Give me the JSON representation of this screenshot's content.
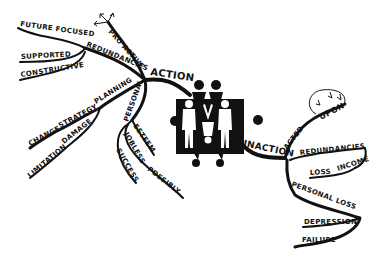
{
  "mind_map": {
    "center": {
      "label": "people emblem",
      "icon": "family-group-icon"
    },
    "colors": {
      "ink": "#111111",
      "background": "#ffffff"
    },
    "action": {
      "label": "ACTION",
      "branches": {
        "pro_active": "PRO ACTIVE",
        "redundancies": "REDUNDANCIES",
        "future_focused": "FUTURE FOCUSED",
        "supported": "SUPPORTED",
        "constructive": "CONSTRUCTIVE",
        "planning": "PLANNING",
        "strategy": "STRATEGY",
        "change": "CHANGE",
        "damage": "DAMAGE",
        "limitation": "LIMITATION",
        "personal": "PERSONAL",
        "esteem": "ESTEEM",
        "jobless": "JOBLESS",
        "possibly": "POSSIBLY",
        "success": "SUCCESS"
      }
    },
    "inaction": {
      "label": "INACTION",
      "branches": {
        "acted": "ACTED",
        "upon": "UPON",
        "redundancies": "REDUNDANCIES",
        "loss": "LOSS",
        "income": "INCOME",
        "personal_loss": "PERSONAL LOSS",
        "depression": "DEPRESSION",
        "failure": "FAILURE"
      }
    }
  }
}
